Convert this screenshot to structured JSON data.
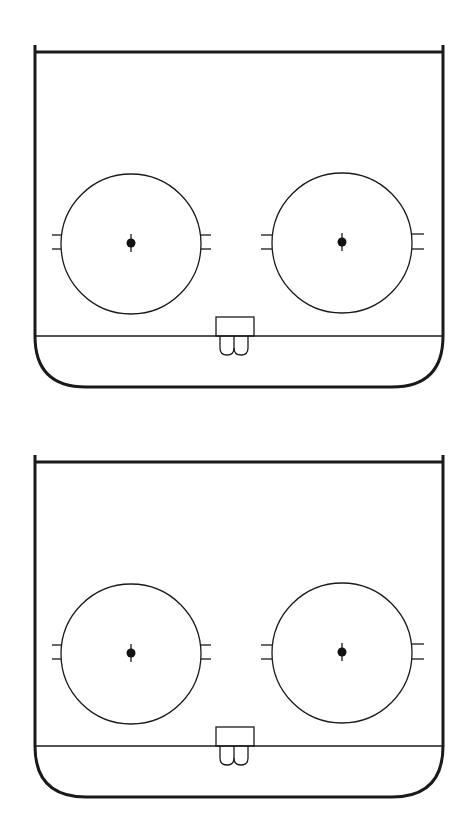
{
  "diagram": {
    "type": "hockey-rink-end-zone",
    "line_color": "#1a1a1a",
    "background": "#ffffff",
    "rinks": [
      {
        "name": "rink-top",
        "offset_y": 0,
        "faceoff_circles": [
          "left",
          "right"
        ],
        "has_goal_crease": true
      },
      {
        "name": "rink-bottom",
        "offset_y": 410,
        "faceoff_circles": [
          "left",
          "right"
        ],
        "has_goal_crease": true
      }
    ]
  }
}
